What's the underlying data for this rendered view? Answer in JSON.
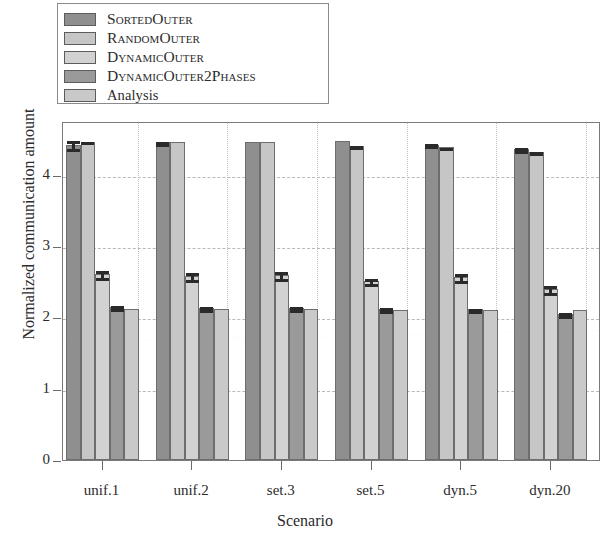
{
  "chart_data": {
    "type": "bar",
    "title": "",
    "xlabel": "Scenario",
    "ylabel": "Normalized communication amount",
    "categories": [
      "unif.1",
      "unif.2",
      "set.3",
      "set.5",
      "dyn.5",
      "dyn.20"
    ],
    "ylim": [
      0,
      4.75
    ],
    "yticks": [
      0,
      1,
      2,
      3,
      4
    ],
    "ytick_labels": [
      "0",
      "1",
      "2",
      "3",
      "4"
    ],
    "grid": "horizontal-and-vertical-dashed",
    "legend_position": "above-plot-left",
    "series": [
      {
        "name": "SortedOuter",
        "color": "#8f8f8f",
        "values": [
          4.42,
          4.45,
          4.45,
          4.47,
          4.42,
          4.36
        ],
        "errors": [
          0.08,
          0.04,
          0.0,
          0.0,
          0.03,
          0.04
        ]
      },
      {
        "name": "RandomOuter",
        "color": "#c6c6c6",
        "values": [
          4.46,
          4.45,
          4.45,
          4.4,
          4.38,
          4.32
        ],
        "errors": [
          0.02,
          0.0,
          0.0,
          0.02,
          0.02,
          0.03
        ]
      },
      {
        "name": "DynamicOuter",
        "color": "#d2d2d2",
        "values": [
          2.6,
          2.58,
          2.59,
          2.51,
          2.56,
          2.39
        ],
        "errors": [
          0.07,
          0.07,
          0.07,
          0.06,
          0.07,
          0.07
        ]
      },
      {
        "name": "DynamicOuter2Phases",
        "color": "#9a9a9a",
        "values": [
          2.14,
          2.13,
          2.13,
          2.12,
          2.11,
          2.05
        ],
        "errors": [
          0.04,
          0.04,
          0.04,
          0.04,
          0.04,
          0.04
        ]
      },
      {
        "name": "Analysis",
        "color": "#c9c9c9",
        "values": [
          2.12,
          2.11,
          2.11,
          2.1,
          2.1,
          2.1
        ],
        "errors": [
          0.0,
          0.0,
          0.0,
          0.0,
          0.0,
          0.0
        ]
      }
    ]
  },
  "legend": {
    "items": [
      {
        "label": "SortedOuter",
        "swatch": "#8f8f8f",
        "smallcaps": true
      },
      {
        "label": "RandomOuter",
        "swatch": "#c6c6c6",
        "smallcaps": true
      },
      {
        "label": "DynamicOuter",
        "swatch": "#d2d2d2",
        "smallcaps": true
      },
      {
        "label": "DynamicOuter2Phases",
        "swatch": "#9a9a9a",
        "smallcaps": true
      },
      {
        "label": "Analysis",
        "swatch": "#c9c9c9",
        "smallcaps": false
      }
    ]
  }
}
